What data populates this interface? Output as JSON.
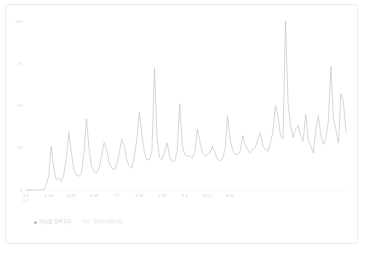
{
  "card": {
    "background": "#ffffff",
    "border_color": "#ececec"
  },
  "legend": {
    "marker_icon": "legend-dot-icon",
    "series_label": "이슈별 검색 추이",
    "note": "자료 : 네이버 데이터랩"
  },
  "chart_data": {
    "type": "line",
    "title": "",
    "subtitle": "",
    "xlabel": "",
    "ylabel": "",
    "grid": false,
    "legend_position": "bottom-left",
    "line_color": "#b9bec6",
    "ylim": [
      0,
      100
    ],
    "yticks": [
      0,
      25,
      50,
      75,
      100
    ],
    "ytick_labels": [
      "0",
      "25",
      "50",
      "75",
      "100"
    ],
    "x_start_sublabel": "2021",
    "xtick_labels": [
      "6.1",
      "6.10",
      "6.19",
      "6.28",
      "7.7",
      "7.16",
      "7.25",
      "8.3",
      "8.12",
      "8.21"
    ],
    "xtick_indices": [
      0,
      9,
      18,
      27,
      36,
      45,
      54,
      63,
      72,
      81
    ],
    "series": [
      {
        "name": "이슈별 검색 추이",
        "values": [
          0,
          0,
          0,
          0,
          0,
          0,
          0,
          0,
          3,
          8,
          26,
          13,
          6,
          7,
          5,
          9,
          19,
          34,
          22,
          12,
          9,
          8,
          10,
          22,
          42,
          25,
          14,
          11,
          10,
          13,
          20,
          28,
          24,
          16,
          13,
          12,
          15,
          22,
          30,
          26,
          18,
          14,
          13,
          20,
          30,
          46,
          33,
          22,
          18,
          18,
          23,
          72,
          31,
          19,
          18,
          22,
          28,
          20,
          17,
          17,
          23,
          51,
          27,
          21,
          20,
          20,
          19,
          22,
          36,
          29,
          22,
          20,
          21,
          22,
          26,
          22,
          18,
          17,
          19,
          24,
          44,
          30,
          24,
          21,
          21,
          23,
          32,
          27,
          24,
          22,
          24,
          25,
          30,
          34,
          26,
          24,
          23,
          28,
          34,
          50,
          44,
          32,
          30,
          100,
          52,
          38,
          31,
          36,
          38,
          32,
          29,
          45,
          30,
          26,
          22,
          35,
          44,
          33,
          27,
          30,
          41,
          73,
          42,
          36,
          28,
          57,
          52,
          34
        ]
      }
    ]
  }
}
